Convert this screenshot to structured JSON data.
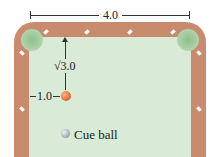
{
  "diagram": {
    "width_label": "4.0",
    "height_label": "√3.0",
    "offset_label": "1.0",
    "cue_ball_label": "Cue ball",
    "colors": {
      "rail": "#c98b6e",
      "felt": "#d9ead6",
      "pocket": "#9cc79a",
      "target_ball": "#e8743a",
      "cue_ball": "#a9b0b8"
    }
  }
}
